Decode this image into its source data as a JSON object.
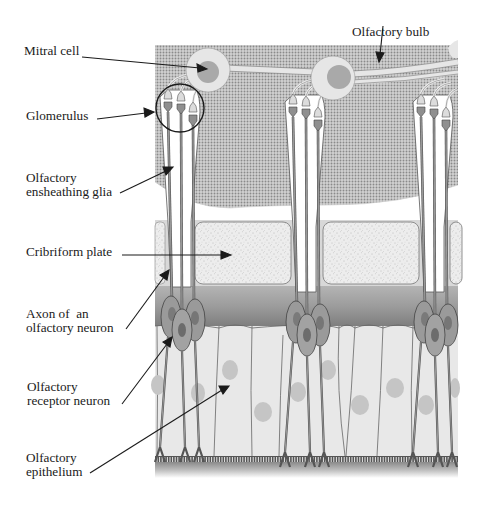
{
  "diagram": {
    "labels": {
      "olfactory_bulb": "Olfactory bulb",
      "mitral_cell": "Mitral cell",
      "glomerulus": "Glomerulus",
      "ensheathing_glia": "Olfactory\nensheathing glia",
      "cribriform_plate": "Cribriform plate",
      "axon": "Axon of  an\nolfactory neuron",
      "receptor_neuron": "Olfactory\nreceptor neuron",
      "epithelium": "Olfactory\nepithelium"
    },
    "colors": {
      "bulb_dots": "#8f8f8f",
      "bulb_bg": "#d6d6d6",
      "mitral_outer": "#e6e6e6",
      "mitral_nucleus": "#a9a9a9",
      "plate_fill": "#ececec",
      "band_dark": "#8a8a8a",
      "epithelium_fill": "#e9e9e9",
      "neuron_body": "#9a9a9a",
      "neuron_nucleus": "#6f6f6f",
      "outline": "#3c3c3c",
      "text": "#1a1a1a"
    }
  }
}
